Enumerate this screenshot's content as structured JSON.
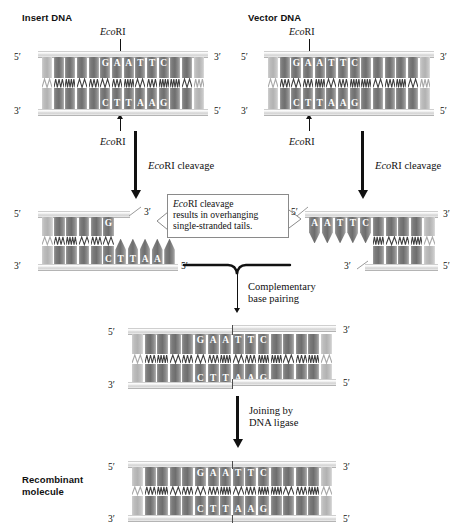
{
  "figure": {
    "title_insert": "Insert DNA",
    "title_vector": "Vector DNA",
    "label_recombinant_l1": "Recombinant",
    "label_recombinant_l2": "molecule"
  },
  "enzyme": {
    "name_italic": "Eco",
    "name_roman": "RI",
    "cleavage_label_roman": " cleavage"
  },
  "steps": {
    "cleavage_insert_italic": "Eco",
    "cleavage_insert_roman": "RI cleavage",
    "cleavage_vector_italic": "Eco",
    "cleavage_vector_roman": "RI cleavage",
    "pairing_l1": "Complementary",
    "pairing_l2": "base pairing",
    "ligase_l1": "Joining by",
    "ligase_l2": "DNA ligase"
  },
  "callout": {
    "italic": "Eco",
    "line1_rest": "RI cleavage",
    "line2": "results in overhanging",
    "line3": "single-stranded tails."
  },
  "primes": {
    "five": "5′",
    "three": "3′"
  },
  "sequences": {
    "recognition_top": "GAATTC",
    "recognition_bottom": "CTTAAG",
    "insert_top_cut": "G",
    "insert_bottom_overhang": "CTTAA",
    "vector_top_overhang": "AATTC",
    "vector_bottom_cut": "G"
  },
  "molecules": {
    "insert_intact": {
      "top": [
        "",
        "",
        "",
        "",
        "",
        "G",
        "A",
        "A",
        "T",
        "T",
        "C",
        "",
        "",
        ""
      ],
      "bottom": [
        "",
        "",
        "",
        "",
        "",
        "C",
        "T",
        "T",
        "A",
        "A",
        "G",
        "",
        "",
        ""
      ],
      "dim": [
        1,
        0,
        0,
        0,
        0,
        0,
        0,
        0,
        0,
        0,
        0,
        0,
        0,
        1
      ]
    },
    "vector_intact": {
      "top": [
        "",
        "",
        "G",
        "A",
        "A",
        "T",
        "T",
        "C",
        "",
        "",
        "",
        "",
        "",
        ""
      ],
      "bottom": [
        "",
        "",
        "C",
        "T",
        "T",
        "A",
        "A",
        "G",
        "",
        "",
        "",
        "",
        "",
        ""
      ],
      "dim": [
        1,
        0,
        0,
        0,
        0,
        0,
        0,
        0,
        0,
        0,
        0,
        0,
        0,
        1
      ]
    },
    "insert_cut": {
      "top": [
        "",
        "",
        "",
        "",
        "",
        "G",
        "",
        "",
        "",
        "",
        ""
      ],
      "bottom": [
        "",
        "",
        "",
        "",
        "",
        "C",
        "T",
        "T",
        "A",
        "A",
        ""
      ],
      "dim": [
        1,
        0,
        0,
        0,
        0,
        0,
        0,
        0,
        0,
        0,
        0
      ]
    },
    "vector_cut": {
      "top": [
        "A",
        "A",
        "T",
        "T",
        "C",
        "",
        "",
        "",
        "",
        ""
      ],
      "bottom": [
        "",
        "",
        "",
        "",
        "G",
        "",
        "",
        "",
        "",
        ""
      ],
      "dim": [
        0,
        0,
        0,
        0,
        0,
        0,
        0,
        0,
        0,
        1
      ]
    },
    "annealed": {
      "top": [
        "",
        "",
        "",
        "",
        "",
        "G",
        "A",
        "A",
        "T",
        "T",
        "C",
        "",
        "",
        "",
        "",
        ""
      ],
      "bottom": [
        "",
        "",
        "",
        "",
        "",
        "C",
        "T",
        "T",
        "A",
        "A",
        "G",
        "",
        "",
        "",
        "",
        ""
      ],
      "dim": [
        1,
        0,
        0,
        0,
        0,
        0,
        0,
        0,
        0,
        0,
        0,
        0,
        0,
        0,
        0,
        1
      ]
    },
    "recombinant": {
      "top": [
        "",
        "",
        "",
        "",
        "",
        "G",
        "A",
        "A",
        "T",
        "T",
        "C",
        "",
        "",
        "",
        "",
        ""
      ],
      "bottom": [
        "",
        "",
        "",
        "",
        "",
        "C",
        "T",
        "T",
        "A",
        "A",
        "G",
        "",
        "",
        "",
        "",
        ""
      ],
      "dim": [
        1,
        0,
        0,
        0,
        0,
        0,
        0,
        0,
        0,
        0,
        0,
        0,
        0,
        0,
        0,
        1
      ]
    }
  },
  "colors": {
    "ink": "#111111",
    "base_dark": "#6e6e6e",
    "base_light": "#b2b2b2",
    "backbone": "#d2d2d2",
    "callout_border": "#8a8a8a"
  }
}
